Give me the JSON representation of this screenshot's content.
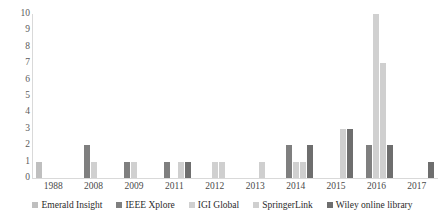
{
  "chart_data": {
    "type": "bar",
    "title": "",
    "subtitle": "",
    "xlabel": "",
    "ylabel": "",
    "categories": [
      "1988",
      "2008",
      "2009",
      "2011",
      "2012",
      "2013",
      "2014",
      "2015",
      "2016",
      "2017"
    ],
    "ylim": [
      0,
      10
    ],
    "yticks": [
      0,
      1,
      2,
      3,
      4,
      5,
      6,
      7,
      8,
      9,
      10
    ],
    "ytick_labels": [
      "0",
      "1",
      "2",
      "3",
      "4",
      "5",
      "6",
      "7",
      "8",
      "9",
      "10"
    ],
    "grid": false,
    "legend_position": "bottom",
    "series": [
      {
        "name": "Emerald Insight",
        "color": "#bfbfbf",
        "values": [
          1,
          0,
          0,
          0,
          0,
          0,
          0,
          0,
          0,
          0
        ]
      },
      {
        "name": "IEEE Xplore",
        "color": "#7f7f7f",
        "values": [
          0,
          2,
          1,
          1,
          0,
          0,
          2,
          0,
          2,
          0
        ]
      },
      {
        "name": "IGI Global",
        "color": "#d0d0d0",
        "values": [
          0,
          1,
          1,
          0,
          1,
          0,
          1,
          0,
          10,
          0
        ]
      },
      {
        "name": "SpringerLink",
        "color": "#cfcfcf",
        "values": [
          0,
          0,
          0,
          1,
          1,
          1,
          1,
          3,
          7,
          0
        ]
      },
      {
        "name": "Wiley online library",
        "color": "#6e6e6e",
        "values": [
          0,
          0,
          0,
          1,
          0,
          0,
          2,
          3,
          2,
          1
        ]
      }
    ]
  },
  "axis": {
    "y_max_label": "10",
    "y_min_label": "0"
  }
}
